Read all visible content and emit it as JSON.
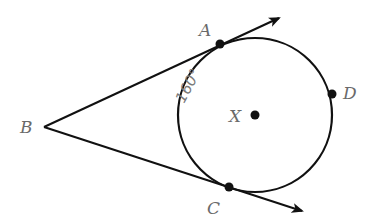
{
  "diagram": {
    "type": "geometry-circle-tangents",
    "colors": {
      "stroke": "#111111",
      "label": "#6a6a6a",
      "handwriting": "#7a7a7a",
      "background": "#ffffff"
    },
    "points": {
      "A": {
        "label": "A",
        "x": 220,
        "y": 44
      },
      "B": {
        "label": "B",
        "x": 44,
        "y": 127
      },
      "C": {
        "label": "C",
        "x": 229,
        "y": 187
      },
      "D": {
        "label": "D",
        "x": 332,
        "y": 94
      },
      "X": {
        "label": "X",
        "x": 255,
        "y": 115
      }
    },
    "circle": {
      "center": "X",
      "cx": 255,
      "cy": 115,
      "r": 77
    },
    "rays": [
      {
        "from": "B",
        "through": "A",
        "arrow_tip": {
          "x": 279,
          "y": 18
        }
      },
      {
        "from": "B",
        "through": "C",
        "arrow_tip": {
          "x": 302,
          "y": 211
        }
      }
    ],
    "arc_annotation": {
      "text": "160°",
      "arc": "AC (minor, left side)",
      "handwritten": true
    }
  }
}
